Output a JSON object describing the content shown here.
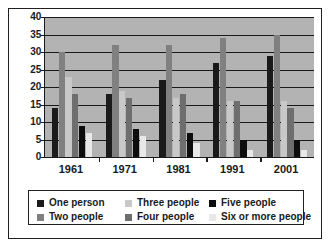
{
  "chart_data": {
    "type": "bar",
    "title": "",
    "subtitle": "",
    "xlabel": "",
    "ylabel": "",
    "categories": [
      "1961",
      "1971",
      "1981",
      "1991",
      "2001"
    ],
    "ylim": [
      0,
      40
    ],
    "yticks": [
      0,
      5,
      10,
      15,
      20,
      25,
      30,
      35,
      40
    ],
    "ytick_labels": [
      "0",
      "5",
      "10",
      "15",
      "20",
      "25",
      "30",
      "35",
      "40"
    ],
    "grid": true,
    "legend_position": "bottom",
    "plot_background": "#b3b3b3",
    "series": [
      {
        "name": "One person",
        "color": "#1a1a1a",
        "values": [
          14,
          18,
          22,
          27,
          29
        ]
      },
      {
        "name": "Two people",
        "color": "#808080",
        "values": [
          30,
          32,
          32,
          34,
          35
        ]
      },
      {
        "name": "Three people",
        "color": "#c8c8c8",
        "values": [
          23,
          19,
          17,
          16,
          16
        ]
      },
      {
        "name": "Four people",
        "color": "#6e6e6e",
        "values": [
          18,
          17,
          18,
          16,
          14
        ]
      },
      {
        "name": "Five people",
        "color": "#0d0d0d",
        "values": [
          9,
          8,
          7,
          5,
          5
        ]
      },
      {
        "name": "Six or more people",
        "color": "#e8e8e8",
        "values": [
          7,
          6,
          4,
          2,
          2
        ]
      }
    ]
  },
  "legend": {
    "items": [
      {
        "label": "One person",
        "color": "#1a1a1a"
      },
      {
        "label": "Two people",
        "color": "#808080"
      },
      {
        "label": "Three people",
        "color": "#c8c8c8"
      },
      {
        "label": "Four people",
        "color": "#6e6e6e"
      },
      {
        "label": "Five people",
        "color": "#0d0d0d"
      },
      {
        "label": "Six or more people",
        "color": "#e8e8e8"
      }
    ]
  }
}
